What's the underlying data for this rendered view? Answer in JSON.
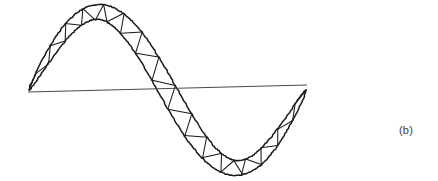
{
  "figure": {
    "label": "(b)",
    "caption_position": {
      "x": 399,
      "y": 125
    },
    "background_color": "#ffffff",
    "ink_color": "#1a1a1a",
    "axis_color": "#4a4a4a",
    "canvas": {
      "width": 438,
      "height": 181
    }
  },
  "chart_data": {
    "type": "line",
    "title": "",
    "subtitle": "",
    "xlabel": "",
    "ylabel": "",
    "grid": false,
    "legend_position": "none",
    "annotations": [
      "(b)"
    ],
    "axis_line": {
      "name": "horizontal-axis",
      "x_start": 28,
      "y_start": 92,
      "x_end": 307,
      "y_end": 85
    },
    "xlim": [
      28,
      307
    ],
    "ylim": [
      11,
      172
    ],
    "curve": {
      "name": "sine-truss-centerline",
      "amplitude": 78,
      "baseline_y": 90,
      "x_start": 29,
      "x_end": 306,
      "cycles": 1,
      "phase": "rising-from-zero",
      "key_points": [
        {
          "label": "left-end",
          "x": 29,
          "y": 91
        },
        {
          "label": "crest",
          "x": 95,
          "y": 21
        },
        {
          "label": "zero-crossing",
          "x": 160,
          "y": 90
        },
        {
          "label": "trough",
          "x": 228,
          "y": 163
        },
        {
          "label": "right-end",
          "x": 306,
          "y": 82
        }
      ]
    },
    "truss": {
      "chord_count": 2,
      "depth_px": 18,
      "depth_taper": "tapers to zero at both ends",
      "web_pattern": "zigzag-warren",
      "web_panel_count": 34
    }
  }
}
